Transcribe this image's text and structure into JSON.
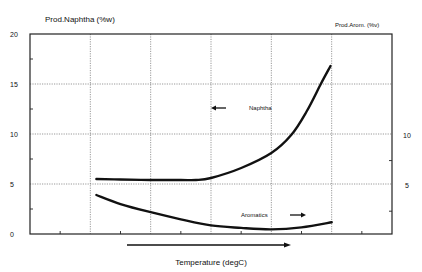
{
  "chart_data": {
    "type": "line",
    "title": "",
    "xlabel": "Temperature (degC)",
    "ylabel": "Prod.Naphtha (%w)",
    "y2label": "Prod.Arom. (%v)",
    "x_note": "x-axis has no numeric tick labels; x values are expressed in major-gridline units (0 = left axis, 6 = right axis)",
    "xlim": [
      0,
      6
    ],
    "ylim": [
      0,
      20
    ],
    "y2lim": [
      0,
      20
    ],
    "yticks": [
      0,
      5,
      10,
      15,
      20
    ],
    "yticklabels": [
      "0",
      "5",
      "10",
      "15",
      "20"
    ],
    "y2ticks": [
      5,
      10
    ],
    "y2ticklabels": [
      "5",
      "10"
    ],
    "grid": true,
    "series": [
      {
        "name": "Naphtha",
        "axis": "left",
        "x": [
          1.1,
          1.5,
          2.0,
          2.5,
          2.75,
          3.0,
          3.5,
          4.0,
          4.33,
          4.58,
          4.82,
          4.98
        ],
        "y": [
          5.5,
          5.45,
          5.4,
          5.4,
          5.4,
          5.6,
          6.6,
          8.1,
          9.9,
          12.2,
          15.0,
          16.8
        ]
      },
      {
        "name": "Aromatics",
        "axis": "right",
        "x": [
          1.1,
          1.5,
          2.0,
          2.5,
          3.0,
          3.5,
          4.0,
          4.5,
          5.0
        ],
        "y": [
          4.1,
          3.2,
          2.4,
          1.7,
          1.1,
          0.85,
          0.7,
          0.9,
          1.4
        ]
      }
    ],
    "annotations": [
      {
        "text": "Naphtha",
        "arrow": "left"
      },
      {
        "text": "Aromatics",
        "arrow": "right"
      },
      {
        "text": "",
        "arrow": "right",
        "note": "increasing temperature arrow below x-axis"
      }
    ]
  }
}
